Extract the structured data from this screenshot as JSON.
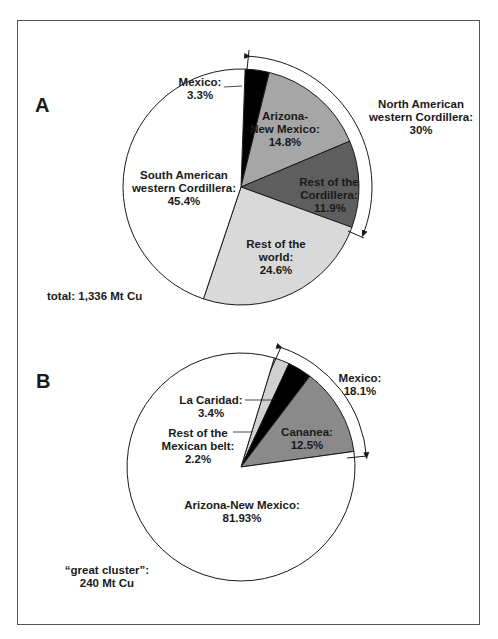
{
  "chart_data": [
    {
      "type": "pie",
      "panel": "A",
      "title": "",
      "total_label": "total: 1,336 Mt Cu",
      "start_angle_deg": 2,
      "slices": [
        {
          "label": "Mexico",
          "value": 3.3,
          "display": [
            "Mexico:",
            "3.3%"
          ],
          "color": "#000000"
        },
        {
          "label": "Arizona-New Mexico",
          "value": 14.8,
          "display": [
            "Arizona-",
            "New Mexico:",
            "14.8%"
          ],
          "color": "#a6a6a6"
        },
        {
          "label": "Rest of the Cordillera",
          "value": 11.9,
          "display": [
            "Rest of the",
            "Cordillera:",
            "11.9%"
          ],
          "color": "#5e5e5e"
        },
        {
          "label": "Rest of the world",
          "value": 24.6,
          "display": [
            "Rest of the",
            "world:",
            "24.6%"
          ],
          "color": "#d9d9d9"
        },
        {
          "label": "South American western Cordillera",
          "value": 45.4,
          "display": [
            "South American",
            "western Cordillera:",
            "45.4%"
          ],
          "color": "#ffffff"
        }
      ],
      "annotation": {
        "text": [
          "North American",
          "western Cordillera:",
          "30%"
        ],
        "value": 30
      }
    },
    {
      "type": "pie",
      "panel": "B",
      "title": "",
      "total_label": [
        "“great cluster”:",
        "240 Mt Cu"
      ],
      "start_angle_deg": 17,
      "slices": [
        {
          "label": "Rest of the Mexican belt",
          "value": 2.2,
          "display": [
            "Rest of the",
            "Mexican belt:",
            "2.2%"
          ],
          "color": "#d0d0d0"
        },
        {
          "label": "La Caridad",
          "value": 3.4,
          "display": [
            "La Caridad:",
            "3.4%"
          ],
          "color": "#000000"
        },
        {
          "label": "Cananea",
          "value": 12.5,
          "display": [
            "Cananea:",
            "12.5%"
          ],
          "color": "#8a8a8a"
        },
        {
          "label": "Arizona-New Mexico",
          "value": 81.93,
          "display": [
            "Arizona-New Mexico:",
            "81.93%"
          ],
          "color": "#ffffff"
        }
      ],
      "annotation": {
        "text": [
          "Mexico:",
          "18.1%"
        ],
        "value": 18.1
      }
    }
  ],
  "labels": {
    "panel_a": "A",
    "panel_b": "B",
    "a": {
      "mexico_1": "Mexico:",
      "mexico_2": "3.3%",
      "az_1": "Arizona-",
      "az_2": "New Mexico:",
      "az_3": "14.8%",
      "rc_1": "Rest of the",
      "rc_2": "Cordillera:",
      "rc_3": "11.9%",
      "rw_1": "Rest of the",
      "rw_2": "world:",
      "rw_3": "24.6%",
      "sa_1": "South American",
      "sa_2": "western Cordillera:",
      "sa_3": "45.4%",
      "na_1": "North American",
      "na_2": "western Cordillera:",
      "na_3": "30%",
      "total": "total: 1,336 Mt Cu"
    },
    "b": {
      "lc_1": "La Caridad:",
      "lc_2": "3.4%",
      "rb_1": "Rest of the",
      "rb_2": "Mexican belt:",
      "rb_3": "2.2%",
      "ca_1": "Cananea:",
      "ca_2": "12.5%",
      "mx_1": "Mexico:",
      "mx_2": "18.1%",
      "az_1": "Arizona-New Mexico:",
      "az_2": "81.93%",
      "gc_1": "“great cluster”:",
      "gc_2": "240 Mt Cu"
    }
  }
}
